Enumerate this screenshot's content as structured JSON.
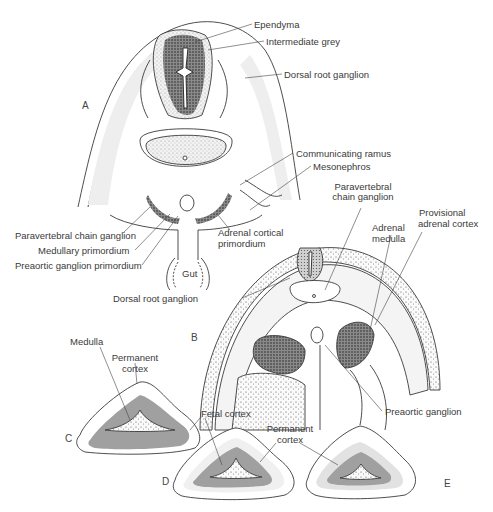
{
  "figure": {
    "panels": {
      "A": "A",
      "B": "B",
      "C": "C",
      "D": "D",
      "E": "E"
    },
    "panel_A_labels": {
      "ependyma": "Ependyma",
      "intermediate_grey": "Intermediate grey",
      "dorsal_root_ganglion": "Dorsal root ganglion",
      "communicating_ramus": "Communicating ramus",
      "mesonephros": "Mesonephros",
      "paravertebral_chain_ganglion": "Paravertebral chain ganglion",
      "medullary_primordium": "Medullary primordium",
      "preaortic_ganglion_primordium": "Preaortic ganglion primordium",
      "adrenal_cortical_primordium_1": "Adrenal cortical",
      "adrenal_cortical_primordium_2": "primordium",
      "gut": "Gut"
    },
    "panel_B_labels": {
      "paravertebral_1": "Paravertebral",
      "paravertebral_2": "chain ganglion",
      "provisional_1": "Provisional",
      "provisional_2": "adrenal cortex",
      "adrenal_medulla_1": "Adrenal",
      "adrenal_medulla_2": "medulla",
      "dorsal_root_ganglion": "Dorsal root ganglion",
      "preaortic_ganglion": "Preaortic ganglion"
    },
    "panel_CDE_labels": {
      "medulla": "Medulla",
      "permanent_cortex_C_1": "Permanent",
      "permanent_cortex_C_2": "cortex",
      "fetal_cortex": "Fetal cortex",
      "permanent_cortex_DE_1": "Permanent",
      "permanent_cortex_DE_2": "cortex"
    },
    "colors": {
      "line": "#3a3a3a",
      "stipple_light": "#e6e6e6",
      "stipple_mid": "#c8c8c8",
      "stipple_dark": "#6a6a6a",
      "fetal_cortex_grey": "#9a9a9a",
      "permanent_cortex_light": "#e2e2e2"
    }
  }
}
